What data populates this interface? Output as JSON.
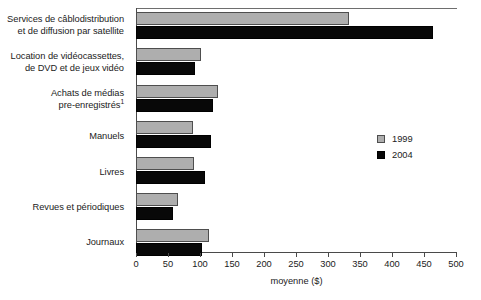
{
  "chart_data": {
    "type": "bar",
    "orientation": "horizontal",
    "title": "",
    "xlabel": "moyenne ($)",
    "ylabel": "",
    "xlim": [
      0,
      500
    ],
    "xticks": [
      0,
      50,
      100,
      150,
      200,
      250,
      300,
      350,
      400,
      450,
      500
    ],
    "xtick_labels": [
      "0",
      "50",
      "100",
      "150",
      "200",
      "250",
      "300",
      "350",
      "400",
      "450",
      "500"
    ],
    "grid": false,
    "legend_position": "center-right",
    "categories": [
      "Services de câblodistribution et de diffusion par satellite",
      "Location de vidéocassettes, de DVD et de jeux vidéo",
      "Achats de médias pre-enregistrés¹",
      "Manuels",
      "Livres",
      "Revues et périodiques",
      "Journaux"
    ],
    "category_lines": [
      [
        "Services de câblodistribution",
        "et de diffusion par satellite"
      ],
      [
        "Location de vidéocassettes,",
        "de DVD et de jeux vidéo"
      ],
      [
        "Achats de médias",
        "pre-enregistrés¹"
      ],
      [
        "Manuels"
      ],
      [
        "Livres"
      ],
      [
        "Revues et périodiques"
      ],
      [
        "Journaux"
      ]
    ],
    "series": [
      {
        "name": "1999",
        "color": "#aeaeae",
        "values": [
          333,
          102,
          128,
          89,
          91,
          66,
          114
        ]
      },
      {
        "name": "2004",
        "color": "#080808",
        "values": [
          464,
          92,
          120,
          117,
          108,
          58,
          103
        ]
      }
    ]
  },
  "legend": {
    "items": [
      {
        "label": "1999",
        "swatch": "gray-swatch"
      },
      {
        "label": "2004",
        "swatch": "black-swatch"
      }
    ]
  },
  "axis": {
    "title": "moyenne ($)"
  }
}
